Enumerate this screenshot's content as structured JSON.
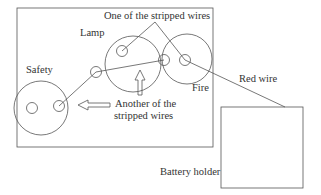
{
  "labels": {
    "lamp": "Lamp",
    "safety": "Safety",
    "fire": "Fire",
    "stripped_wire_one": "One of the stripped wires",
    "stripped_wire_another_line1": "Another of the",
    "stripped_wire_another_line2": "stripped wires",
    "red_wire": "Red wire",
    "battery_holder": "Battery holder"
  },
  "colors": {
    "stroke": "#555555",
    "text": "#333333",
    "background": "#ffffff"
  }
}
